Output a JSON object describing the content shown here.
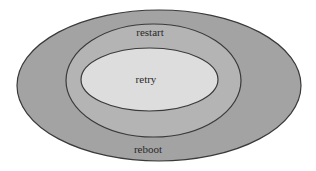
{
  "diagram": {
    "type": "nested-ellipses",
    "background": "#ffffff",
    "stroke_color": "#3a3a3a",
    "layers": [
      {
        "id": "outer",
        "label": "reboot",
        "fill": "#a3a3a3",
        "cx": 159,
        "cy": 85.5,
        "rx": 142,
        "ry": 75.5,
        "label_x": 148,
        "label_y": 153
      },
      {
        "id": "middle",
        "label": "restart",
        "fill": "#b4b4b4",
        "cx": 153.5,
        "cy": 80.5,
        "rx": 87.5,
        "ry": 56.5,
        "label_x": 150,
        "label_y": 36
      },
      {
        "id": "inner",
        "label": "retry",
        "fill": "#dddddd",
        "cx": 149.5,
        "cy": 79.5,
        "rx": 68.5,
        "ry": 31.5,
        "label_x": 146,
        "label_y": 83
      }
    ]
  },
  "labels": {
    "outer": "reboot",
    "middle": "restart",
    "inner": "retry"
  }
}
